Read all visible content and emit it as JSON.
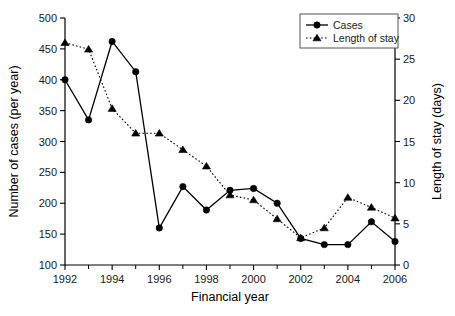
{
  "chart_data": {
    "type": "line",
    "title": "",
    "xlabel": "Financial year",
    "ylabel": "Number of cases (per year)",
    "y2label": "Length of stay (days)",
    "x": [
      1992,
      1993,
      1994,
      1995,
      1996,
      1997,
      1998,
      1999,
      2000,
      2001,
      2002,
      2003,
      2004,
      2005,
      2006
    ],
    "xlim": [
      1992,
      2006
    ],
    "xticklabels": [
      "1992",
      "1994",
      "1996",
      "1998",
      "2000",
      "2002",
      "2004",
      "2006"
    ],
    "xtickvalues": [
      1992,
      1994,
      1996,
      1998,
      2000,
      2002,
      2004,
      2006
    ],
    "xminorticks": [
      1993,
      1995,
      1997,
      1999,
      2001,
      2003,
      2005
    ],
    "ylim": [
      100,
      500
    ],
    "yticklabels": [
      "100",
      "150",
      "200",
      "250",
      "300",
      "350",
      "400",
      "450",
      "500"
    ],
    "ytickvalues": [
      100,
      150,
      200,
      250,
      300,
      350,
      400,
      450,
      500
    ],
    "y2lim": [
      0,
      30
    ],
    "y2ticklabels": [
      "0",
      "5",
      "10",
      "15",
      "20",
      "25",
      "30"
    ],
    "y2tickvalues": [
      0,
      5,
      10,
      15,
      20,
      25,
      30
    ],
    "grid": false,
    "legend_position": "top-right",
    "series": [
      {
        "name": "Cases",
        "axis": "left",
        "marker": "circle",
        "linestyle": "solid",
        "color": "#000000",
        "values": [
          400,
          335,
          462,
          413,
          160,
          227,
          189,
          221,
          224,
          200,
          143,
          133,
          133,
          170,
          138
        ]
      },
      {
        "name": "Length of stay",
        "axis": "right",
        "marker": "triangle",
        "linestyle": "dotted",
        "color": "#000000",
        "values": [
          27.0,
          26.2,
          19.0,
          16.0,
          16.0,
          14.0,
          12.0,
          8.5,
          7.9,
          5.6,
          3.3,
          4.5,
          8.2,
          7.0,
          5.7
        ]
      }
    ]
  },
  "legend": {
    "entries": [
      {
        "label": "Cases"
      },
      {
        "label": "Length of stay"
      }
    ]
  }
}
